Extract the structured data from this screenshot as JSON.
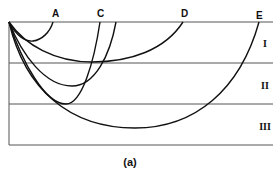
{
  "figure": {
    "caption": "(a)",
    "end_labels": [
      {
        "id": "A",
        "label": "A",
        "x": 56
      },
      {
        "id": "C",
        "label": "C",
        "x": 100
      },
      {
        "id": "D",
        "label": "D",
        "x": 185
      },
      {
        "id": "E",
        "label": "E",
        "x": 260
      }
    ],
    "zones": [
      {
        "id": "I",
        "label": "I"
      },
      {
        "id": "II",
        "label": "II"
      },
      {
        "id": "III",
        "label": "III"
      }
    ],
    "colors": {
      "curve": "#111111",
      "boundary": "#555555",
      "background": "#ffffff"
    }
  }
}
